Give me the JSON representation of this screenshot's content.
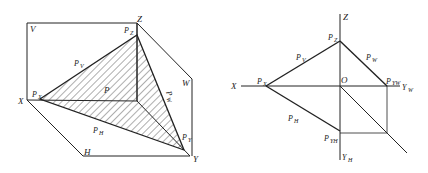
{
  "figure_left": {
    "title": "Pictorial view of plane P (general-position plane) intersecting three projection planes",
    "labels": {
      "V": "V",
      "H": "H",
      "W": "W",
      "X": "X",
      "Y": "Y",
      "Z": "Z",
      "P": "P",
      "PX": "P",
      "PX_sub": "X",
      "PY": "P",
      "PY_sub": "Y",
      "PZ": "P",
      "PZ_sub": "Z",
      "PV": "P",
      "PV_sub": "V",
      "PH": "P",
      "PH_sub": "H",
      "PW": "P",
      "PW_sub": "W"
    }
  },
  "figure_right": {
    "title": "Orthographic projection (trace representation) of plane P",
    "labels": {
      "X": "X",
      "Z": "Z",
      "O": "O",
      "YW": "Y",
      "YW_sub": "W",
      "YH": "Y",
      "YH_sub": "H",
      "PX": "P",
      "PX_sub": "X",
      "PZ": "P",
      "PZ_sub": "Z",
      "PV": "P",
      "PV_sub": "V",
      "PW": "P",
      "PW_sub": "W",
      "PH": "P",
      "PH_sub": "H",
      "PYW": "P",
      "PYW_sub": "YW",
      "PYH": "P",
      "PYH_sub": "YH"
    }
  },
  "colors": {
    "line": "#222222",
    "hatch": "#333333",
    "background": "#ffffff"
  }
}
